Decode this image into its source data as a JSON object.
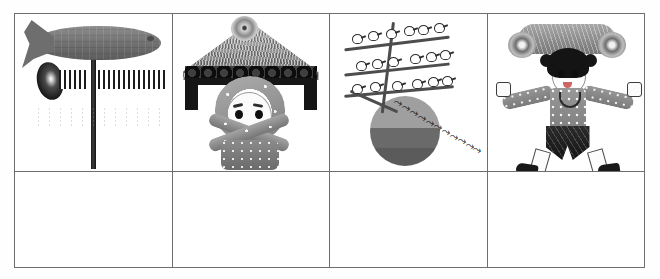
{
  "worksheet": {
    "title": "Seasonal pictures matching worksheet",
    "grid": {
      "columns": 4,
      "rows": 2,
      "top_row_label": "Illustration row",
      "bottom_row_label": "Blank answer row"
    }
  },
  "cells": [
    {
      "index": 1,
      "name": "carp-streamer-cell",
      "caption": "Carp streamer (koinobori) on a tall pole",
      "elements": [
        "carp-body",
        "carp-tail",
        "carp-eye",
        "pole",
        "pole-top-ball",
        "pinwheel-swirl",
        "striped-bar-left",
        "striped-bar-right",
        "paper-streamers"
      ],
      "answer": ""
    },
    {
      "index": 2,
      "name": "thatched-roof-child-cell",
      "caption": "Thatched roof gate above a child's face framed by crossed sashes",
      "elements": [
        "thatched-roof",
        "roof-knob",
        "eaves-bundles",
        "cross-beam",
        "post-left",
        "post-right",
        "child-face",
        "hood",
        "sash-left",
        "sash-right",
        "body-panel"
      ],
      "answer": ""
    },
    {
      "index": 3,
      "name": "birds-branches-sun-cell",
      "caption": "Birds perched on bare branches with a flock flying off past the sun",
      "elements": [
        "branch-upper",
        "branch-middle",
        "branch-lower",
        "trunk",
        "perched-birds",
        "flying-flock",
        "sun-disc"
      ],
      "perched_bird_count": 18,
      "flying_bird_count": 11,
      "branch_count": 3,
      "answer": ""
    },
    {
      "index": 4,
      "name": "child-headdress-cell",
      "caption": "Child standing with arms outstretched wearing an ornate headdress",
      "elements": [
        "headdress-crown",
        "crown-pom-left",
        "crown-pom-right",
        "hair",
        "hair-bun-left",
        "hair-bun-right",
        "face",
        "necklace",
        "patterned-top",
        "arm-left",
        "arm-right",
        "hand-left",
        "hand-right",
        "dark-shorts",
        "leg-wrap-left",
        "leg-wrap-right",
        "boot-left",
        "boot-right"
      ],
      "answer": ""
    }
  ],
  "colors": {
    "border": "#6e6e6e",
    "ink": "#1a1a1a",
    "paper": "#ffffff",
    "mid_gray": "#8d8d8d",
    "dark_gray": "#4d4d4d"
  }
}
